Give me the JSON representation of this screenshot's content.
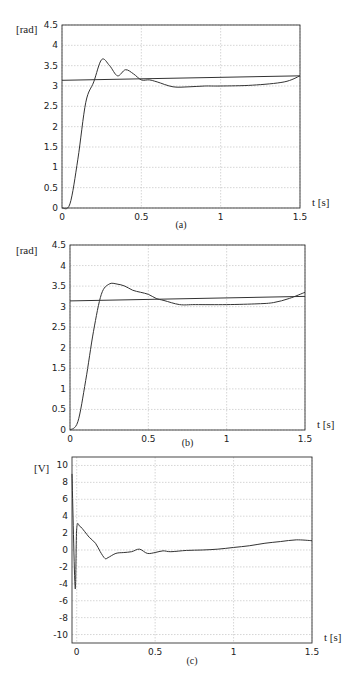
{
  "chart_data": [
    {
      "type": "line",
      "caption": "(a)",
      "ylabel": "[rad]",
      "xlabel": "t [s]",
      "xlim": [
        0,
        1.5
      ],
      "ylim": [
        0,
        4.5
      ],
      "xticks": [
        "0",
        "0.5",
        "1",
        "1.5"
      ],
      "yticks": [
        "0",
        "0.5",
        "1",
        "1.5",
        "2",
        "2.5",
        "3",
        "3.5",
        "4",
        "4.5"
      ],
      "grid": true,
      "series": [
        {
          "name": "response",
          "x": [
            0,
            0.05,
            0.1,
            0.15,
            0.2,
            0.25,
            0.3,
            0.35,
            0.4,
            0.45,
            0.5,
            0.55,
            0.6,
            0.7,
            0.8,
            0.9,
            1.0,
            1.2,
            1.4,
            1.5
          ],
          "y": [
            0,
            0.1,
            1.2,
            2.6,
            3.1,
            3.65,
            3.5,
            3.25,
            3.4,
            3.3,
            3.15,
            3.15,
            3.1,
            2.98,
            2.98,
            3.0,
            3.0,
            3.02,
            3.1,
            3.25
          ]
        },
        {
          "name": "reference",
          "x": [
            0,
            1.5
          ],
          "y": [
            3.14,
            3.25
          ]
        }
      ]
    },
    {
      "type": "line",
      "caption": "(b)",
      "ylabel": "[rad]",
      "xlabel": "t [s]",
      "xlim": [
        0,
        1.5
      ],
      "ylim": [
        0,
        4.5
      ],
      "xticks": [
        "0",
        "0.5",
        "1",
        "1.5"
      ],
      "yticks": [
        "0",
        "0.5",
        "1",
        "1.5",
        "2",
        "2.5",
        "3",
        "3.5",
        "4",
        "4.5"
      ],
      "grid": true,
      "series": [
        {
          "name": "response",
          "x": [
            0,
            0.05,
            0.1,
            0.15,
            0.2,
            0.25,
            0.3,
            0.35,
            0.4,
            0.45,
            0.5,
            0.55,
            0.6,
            0.7,
            0.8,
            1.0,
            1.2,
            1.3,
            1.4,
            1.5
          ],
          "y": [
            0,
            0.2,
            1.2,
            2.4,
            3.3,
            3.55,
            3.55,
            3.5,
            3.4,
            3.35,
            3.3,
            3.2,
            3.15,
            3.05,
            3.05,
            3.05,
            3.07,
            3.1,
            3.2,
            3.35
          ]
        },
        {
          "name": "reference",
          "x": [
            0,
            1.5
          ],
          "y": [
            3.14,
            3.25
          ]
        }
      ]
    },
    {
      "type": "line",
      "caption": "(c)",
      "ylabel": "[V]",
      "xlabel": "t [s]",
      "xlim": [
        -0.03,
        1.5
      ],
      "ylim": [
        -11,
        11
      ],
      "xticks": [
        "0",
        "0.5",
        "1",
        "1.5"
      ],
      "yticks": [
        "-10",
        "-8",
        "-6",
        "-4",
        "-2",
        "0",
        "2",
        "4",
        "6",
        "8",
        "10"
      ],
      "grid": true,
      "series": [
        {
          "name": "control voltage",
          "x": [
            -0.03,
            -0.01,
            0.0,
            0.02,
            0.05,
            0.08,
            0.12,
            0.15,
            0.18,
            0.2,
            0.25,
            0.3,
            0.35,
            0.4,
            0.45,
            0.5,
            0.55,
            0.6,
            0.7,
            0.8,
            0.9,
            1.0,
            1.1,
            1.2,
            1.3,
            1.4,
            1.5
          ],
          "y": [
            9,
            -4.5,
            2.5,
            2.8,
            2.2,
            1.5,
            0.8,
            -0.2,
            -1.0,
            -0.9,
            -0.4,
            -0.3,
            -0.2,
            0.1,
            -0.4,
            -0.3,
            -0.1,
            -0.2,
            -0.05,
            0.0,
            0.1,
            0.3,
            0.5,
            0.8,
            1.0,
            1.2,
            1.1
          ]
        }
      ]
    }
  ]
}
